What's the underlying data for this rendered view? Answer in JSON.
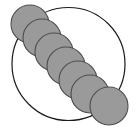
{
  "canvas": {
    "width": 138,
    "height": 130,
    "background_color": "#ffffff"
  },
  "diagram": {
    "type": "geometric-figure",
    "element_count": 7
  },
  "chart_data": {
    "type": "scatter",
    "xlabel": "",
    "ylabel": "",
    "xlim": [
      0,
      138
    ],
    "ylim": [
      0,
      130
    ],
    "grid": false,
    "legend": "none",
    "annotations": [],
    "series": [
      {
        "name": "bounding-circle",
        "shape": "circle",
        "fill": "none",
        "stroke": "#1a1a1a",
        "stroke_width": 1.2,
        "values": [
          {
            "label": "outer-circle",
            "cx": 68.5,
            "cy": 64,
            "r": 56.5
          }
        ]
      },
      {
        "name": "disk-chain",
        "shape": "circle",
        "fill": "#9a9a9a",
        "stroke": "#4d4d4d",
        "stroke_width": 1.1,
        "values": [
          {
            "label": "disk-1",
            "cx": 30,
            "cy": 24,
            "r": 19
          },
          {
            "label": "disk-2",
            "cx": 42,
            "cy": 38,
            "r": 19
          },
          {
            "label": "disk-3",
            "cx": 54,
            "cy": 52,
            "r": 19
          },
          {
            "label": "disk-4",
            "cx": 66,
            "cy": 66,
            "r": 19
          },
          {
            "label": "disk-5",
            "cx": 78,
            "cy": 80,
            "r": 19
          },
          {
            "label": "disk-6",
            "cx": 90,
            "cy": 94,
            "r": 19
          },
          {
            "label": "disk-7",
            "cx": 109,
            "cy": 106,
            "r": 19
          }
        ]
      }
    ]
  },
  "colors": {
    "disk_fill": "#9a9a9a",
    "disk_stroke": "#4d4d4d",
    "outline_stroke": "#1a1a1a",
    "background": "#ffffff"
  }
}
